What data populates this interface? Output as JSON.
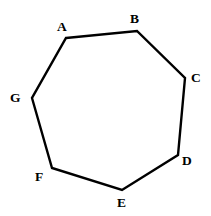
{
  "figure": {
    "kind": "geometry-diagram",
    "shape_name": "heptagon",
    "sides": 7,
    "width": 211,
    "height": 216,
    "background_color": "#ffffff",
    "stroke_color": "#000000",
    "stroke_width": 2.4,
    "fill_color": "none",
    "label_color": "#000000",
    "label_font_size": 13.5,
    "label_font_weight": "bold"
  },
  "vertices": [
    {
      "id": "A",
      "label": "A",
      "x": 66,
      "y": 38,
      "label_x": 57,
      "label_y": 20,
      "label_anchor": "above-left"
    },
    {
      "id": "B",
      "label": "B",
      "x": 137,
      "y": 31,
      "label_x": 130,
      "label_y": 12,
      "label_anchor": "above"
    },
    {
      "id": "C",
      "label": "C",
      "x": 185,
      "y": 78,
      "label_x": 191,
      "label_y": 71,
      "label_anchor": "right"
    },
    {
      "id": "D",
      "label": "D",
      "x": 178,
      "y": 155,
      "label_x": 182,
      "label_y": 154,
      "label_anchor": "right-below"
    },
    {
      "id": "E",
      "label": "E",
      "x": 122,
      "y": 190,
      "label_x": 117,
      "label_y": 196,
      "label_anchor": "below"
    },
    {
      "id": "F",
      "label": "F",
      "x": 52,
      "y": 168,
      "label_x": 35,
      "label_y": 170,
      "label_anchor": "left-below"
    },
    {
      "id": "G",
      "label": "G",
      "x": 32,
      "y": 98,
      "label_x": 10,
      "label_y": 91,
      "label_anchor": "left"
    }
  ],
  "edges": [
    {
      "from": "A",
      "to": "B"
    },
    {
      "from": "B",
      "to": "C"
    },
    {
      "from": "C",
      "to": "D"
    },
    {
      "from": "D",
      "to": "E"
    },
    {
      "from": "E",
      "to": "F"
    },
    {
      "from": "F",
      "to": "G"
    },
    {
      "from": "G",
      "to": "A"
    }
  ]
}
